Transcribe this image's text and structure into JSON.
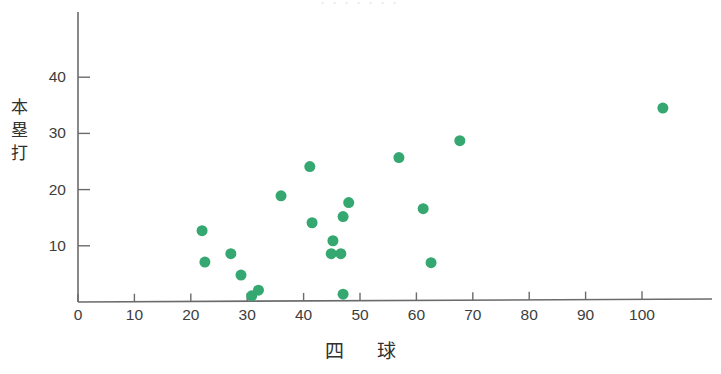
{
  "figure": {
    "title_remnant": "・・・・・・・",
    "background_color": "#ffffff",
    "axis_color": "#6b6b6b",
    "marker_color": "#34a870"
  },
  "chart_data": {
    "type": "scatter",
    "title": "",
    "xlabel": "四　球",
    "ylabel": "本塁打",
    "ylabel_chars": [
      "本",
      "塁",
      "打"
    ],
    "xlim": [
      0,
      110
    ],
    "ylim": [
      0,
      47
    ],
    "grid": false,
    "legend": null,
    "xticks": [
      0,
      10,
      20,
      30,
      40,
      50,
      60,
      70,
      80,
      90,
      100
    ],
    "xtick_labels": [
      "0",
      "10",
      "20",
      "30",
      "40",
      "50",
      "60",
      "70",
      "80",
      "90",
      "100"
    ],
    "yticks": [
      10,
      20,
      30,
      40
    ],
    "ytick_labels": [
      "10",
      "20",
      "30",
      "40"
    ],
    "marker": {
      "shape": "circle",
      "color": "#34a870",
      "size_px": 11
    },
    "points": [
      {
        "x": 22.0,
        "y": 12.7
      },
      {
        "x": 22.5,
        "y": 7.1
      },
      {
        "x": 27.1,
        "y": 8.6
      },
      {
        "x": 28.9,
        "y": 4.8
      },
      {
        "x": 30.8,
        "y": 1.1
      },
      {
        "x": 32.0,
        "y": 2.1
      },
      {
        "x": 36.0,
        "y": 18.9
      },
      {
        "x": 41.1,
        "y": 24.1
      },
      {
        "x": 41.5,
        "y": 14.1
      },
      {
        "x": 44.9,
        "y": 8.6
      },
      {
        "x": 45.2,
        "y": 10.9
      },
      {
        "x": 46.6,
        "y": 8.6
      },
      {
        "x": 47.0,
        "y": 1.4
      },
      {
        "x": 47.0,
        "y": 15.2
      },
      {
        "x": 48.0,
        "y": 17.7
      },
      {
        "x": 56.9,
        "y": 25.7
      },
      {
        "x": 61.2,
        "y": 16.6
      },
      {
        "x": 62.6,
        "y": 7.0
      },
      {
        "x": 67.7,
        "y": 28.7
      },
      {
        "x": 103.7,
        "y": 34.5
      }
    ],
    "n_points": 20
  }
}
